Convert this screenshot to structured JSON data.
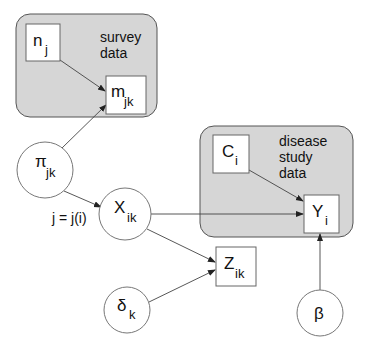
{
  "diagram": {
    "type": "graphical-model",
    "plates": [
      {
        "id": "survey",
        "label_lines": [
          "survey",
          "data"
        ]
      },
      {
        "id": "disease",
        "label_lines": [
          "disease",
          "study",
          "data"
        ]
      }
    ],
    "nodes": {
      "n": {
        "shape": "box",
        "main": "n",
        "sub": "j"
      },
      "m": {
        "shape": "box",
        "main": "m",
        "sub": "jk"
      },
      "pi": {
        "shape": "circle",
        "main": "π",
        "sub": "jk"
      },
      "X": {
        "shape": "circle",
        "main": "X",
        "sub": "ik"
      },
      "C": {
        "shape": "box",
        "main": "C",
        "sub": "i"
      },
      "Y": {
        "shape": "box",
        "main": "Y",
        "sub": "i"
      },
      "Z": {
        "shape": "box",
        "main": "Z",
        "sub": "ik"
      },
      "delta": {
        "shape": "circle",
        "main": "δ",
        "sub": "k"
      },
      "beta": {
        "shape": "circle",
        "main": "β",
        "sub": ""
      }
    },
    "edges": [
      {
        "from": "n_j",
        "to": "m_jk"
      },
      {
        "from": "π_jk",
        "to": "m_jk"
      },
      {
        "from": "π_jk",
        "to": "X_ik",
        "label": "j = j(i)"
      },
      {
        "from": "X_ik",
        "to": "Y_i"
      },
      {
        "from": "C_i",
        "to": "Y_i"
      },
      {
        "from": "X_ik",
        "to": "Z_ik"
      },
      {
        "from": "δ_k",
        "to": "Z_ik"
      },
      {
        "from": "β",
        "to": "Y_i"
      }
    ],
    "edge_label": "j = j(i)"
  }
}
